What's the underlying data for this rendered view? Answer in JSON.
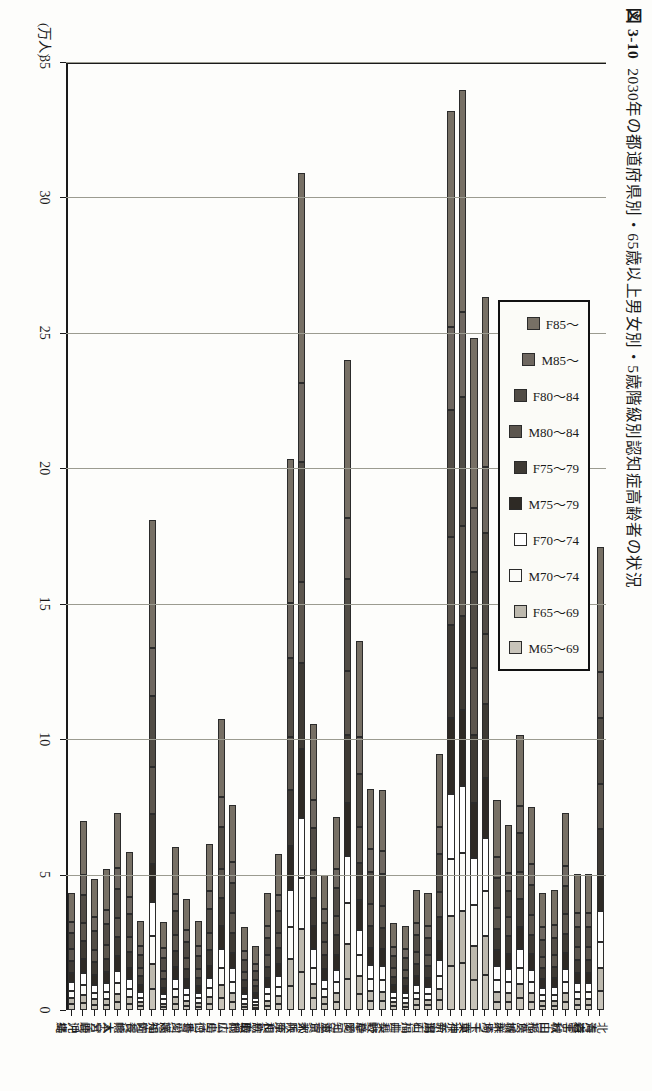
{
  "figure": {
    "number": "図 3-10",
    "title": "2030年の都道府県別・65歳以上男女別・5歳階級別認知症高齢者の状況",
    "unit_label": "(万人)"
  },
  "legend": {
    "items": [
      {
        "label": "F85～",
        "color": "#777065"
      },
      {
        "label": "M85～",
        "color": "#6e6760"
      },
      {
        "label": "F80～84",
        "color": "#514c45"
      },
      {
        "label": "M80～84",
        "color": "#5c564e"
      },
      {
        "label": "F75～79",
        "color": "#3e3a34"
      },
      {
        "label": "M75～79",
        "color": "#2e2a25"
      },
      {
        "label": "F70～74",
        "color": "#ffffff"
      },
      {
        "label": "M70～74",
        "color": "#fbfbf8"
      },
      {
        "label": "F65～69",
        "color": "#bdb9ae"
      },
      {
        "label": "M65～69",
        "color": "#c8c4ba"
      }
    ]
  },
  "chart_data": {
    "type": "bar",
    "orientation": "horizontal-stacked",
    "title": "2030年の都道府県別・65歳以上男女別・5歳階級別認知症高齢者の状況",
    "xlabel": "",
    "ylabel": "(万人)",
    "ylim": [
      0,
      35
    ],
    "yticks": [
      0,
      5,
      10,
      15,
      20,
      25,
      30,
      35
    ],
    "grid": true,
    "legend_position": "top-center",
    "categories": [
      "北海道",
      "青森",
      "岩手",
      "宮城",
      "秋田",
      "山形",
      "福島",
      "茨城",
      "栃木",
      "群馬",
      "埼玉",
      "千葉",
      "東京",
      "神奈川",
      "新潟",
      "富山",
      "石川",
      "福井",
      "山梨",
      "長野",
      "岐阜",
      "静岡",
      "愛知",
      "三重",
      "滋賀",
      "京都",
      "大阪",
      "兵庫",
      "奈良",
      "和歌山",
      "鳥取",
      "島根",
      "岡山",
      "広島",
      "山口",
      "徳島",
      "香川",
      "愛媛",
      "高知",
      "福岡",
      "佐賀",
      "長崎",
      "熊本",
      "大分",
      "宮崎",
      "鹿児島",
      "沖縄"
    ],
    "series": [
      {
        "name": "M65～69",
        "values": [
          0.72,
          0.19,
          0.19,
          0.3,
          0.16,
          0.16,
          0.29,
          0.45,
          0.3,
          0.31,
          1.28,
          1.11,
          1.72,
          1.63,
          0.36,
          0.17,
          0.18,
          0.12,
          0.13,
          0.32,
          0.32,
          0.58,
          1.15,
          0.29,
          0.22,
          0.44,
          1.4,
          0.87,
          0.24,
          0.16,
          0.09,
          0.11,
          0.3,
          0.44,
          0.22,
          0.12,
          0.16,
          0.22,
          0.11,
          0.79,
          0.13,
          0.22,
          0.28,
          0.19,
          0.18,
          0.26,
          0.21
        ]
      },
      {
        "name": "F65～69",
        "values": [
          0.83,
          0.22,
          0.22,
          0.34,
          0.19,
          0.18,
          0.33,
          0.51,
          0.34,
          0.36,
          1.44,
          1.27,
          1.92,
          1.83,
          0.41,
          0.19,
          0.21,
          0.14,
          0.15,
          0.36,
          0.37,
          0.66,
          1.29,
          0.33,
          0.25,
          0.51,
          1.6,
          1.0,
          0.28,
          0.19,
          0.1,
          0.13,
          0.34,
          0.5,
          0.26,
          0.14,
          0.18,
          0.25,
          0.13,
          0.9,
          0.15,
          0.25,
          0.32,
          0.22,
          0.21,
          0.3,
          0.24
        ]
      },
      {
        "name": "M70～74",
        "values": [
          0.96,
          0.26,
          0.26,
          0.41,
          0.22,
          0.22,
          0.4,
          0.6,
          0.4,
          0.43,
          1.68,
          1.48,
          2.16,
          2.1,
          0.49,
          0.23,
          0.25,
          0.17,
          0.18,
          0.44,
          0.45,
          0.79,
          1.5,
          0.4,
          0.3,
          0.6,
          1.88,
          1.18,
          0.33,
          0.23,
          0.12,
          0.16,
          0.41,
          0.6,
          0.32,
          0.17,
          0.22,
          0.31,
          0.16,
          1.05,
          0.18,
          0.3,
          0.39,
          0.27,
          0.25,
          0.36,
          0.27
        ]
      },
      {
        "name": "F70～74",
        "values": [
          1.14,
          0.31,
          0.31,
          0.48,
          0.27,
          0.26,
          0.47,
          0.7,
          0.47,
          0.51,
          1.94,
          1.74,
          2.46,
          2.42,
          0.58,
          0.27,
          0.29,
          0.2,
          0.21,
          0.52,
          0.53,
          0.93,
          1.73,
          0.47,
          0.35,
          0.71,
          2.2,
          1.39,
          0.39,
          0.27,
          0.15,
          0.19,
          0.49,
          0.71,
          0.38,
          0.2,
          0.26,
          0.37,
          0.19,
          1.23,
          0.21,
          0.36,
          0.46,
          0.32,
          0.3,
          0.43,
          0.31
        ]
      },
      {
        "name": "M75～79",
        "values": [
          1.33,
          0.38,
          0.38,
          0.57,
          0.33,
          0.32,
          0.57,
          0.82,
          0.55,
          0.61,
          2.22,
          2.03,
          2.82,
          2.79,
          0.71,
          0.33,
          0.34,
          0.24,
          0.25,
          0.62,
          0.63,
          1.09,
          1.99,
          0.56,
          0.4,
          0.83,
          2.55,
          1.62,
          0.46,
          0.33,
          0.18,
          0.23,
          0.58,
          0.84,
          0.46,
          0.25,
          0.31,
          0.45,
          0.24,
          1.43,
          0.25,
          0.44,
          0.55,
          0.39,
          0.36,
          0.52,
          0.35
        ]
      },
      {
        "name": "F75～79",
        "values": [
          1.69,
          0.48,
          0.48,
          0.72,
          0.42,
          0.41,
          0.72,
          1.02,
          0.69,
          0.77,
          2.74,
          2.54,
          3.48,
          3.44,
          0.9,
          0.42,
          0.43,
          0.3,
          0.31,
          0.78,
          0.8,
          1.37,
          2.48,
          0.71,
          0.5,
          1.06,
          3.17,
          2.05,
          0.58,
          0.42,
          0.23,
          0.29,
          0.74,
          1.06,
          0.59,
          0.32,
          0.4,
          0.58,
          0.31,
          1.82,
          0.32,
          0.56,
          0.7,
          0.5,
          0.46,
          0.67,
          0.44
        ]
      },
      {
        "name": "M80～84",
        "values": [
          1.66,
          0.49,
          0.49,
          0.71,
          0.43,
          0.42,
          0.73,
          0.99,
          0.67,
          0.76,
          2.6,
          2.45,
          3.32,
          3.27,
          0.92,
          0.42,
          0.43,
          0.3,
          0.31,
          0.79,
          0.8,
          1.34,
          2.36,
          0.7,
          0.49,
          1.03,
          3.02,
          1.98,
          0.56,
          0.42,
          0.23,
          0.3,
          0.74,
          1.05,
          0.6,
          0.32,
          0.4,
          0.59,
          0.32,
          1.77,
          0.32,
          0.57,
          0.71,
          0.51,
          0.47,
          0.68,
          0.42
        ]
      },
      {
        "name": "F80～84",
        "values": [
          2.46,
          0.73,
          0.73,
          1.05,
          0.65,
          0.63,
          1.09,
          1.44,
          0.97,
          1.12,
          3.72,
          3.55,
          4.76,
          4.68,
          1.38,
          0.63,
          0.64,
          0.45,
          0.46,
          1.18,
          1.19,
          1.97,
          3.42,
          1.04,
          0.72,
          1.53,
          4.4,
          2.92,
          0.83,
          0.63,
          0.35,
          0.45,
          1.1,
          1.56,
          0.9,
          0.48,
          0.6,
          0.88,
          0.48,
          2.6,
          0.48,
          0.85,
          1.06,
          0.76,
          0.7,
          1.02,
          0.61
        ]
      },
      {
        "name": "M85～",
        "values": [
          1.7,
          0.53,
          0.53,
          0.74,
          0.48,
          0.47,
          0.79,
          0.99,
          0.67,
          0.79,
          2.42,
          2.37,
          3.14,
          3.07,
          1.0,
          0.45,
          0.45,
          0.32,
          0.33,
          0.85,
          0.84,
          1.35,
          2.25,
          0.72,
          0.49,
          1.05,
          2.95,
          2.01,
          0.57,
          0.45,
          0.25,
          0.33,
          0.78,
          1.09,
          0.65,
          0.35,
          0.43,
          0.64,
          0.35,
          1.78,
          0.34,
          0.62,
          0.76,
          0.55,
          0.51,
          0.74,
          0.41
        ]
      },
      {
        "name": "F85～",
        "values": [
          4.61,
          1.42,
          1.42,
          1.97,
          1.3,
          1.27,
          2.12,
          2.62,
          1.77,
          2.1,
          6.28,
          6.26,
          8.19,
          7.97,
          2.7,
          1.2,
          1.21,
          0.86,
          0.88,
          2.28,
          2.24,
          3.54,
          5.82,
          1.92,
          1.28,
          2.8,
          7.73,
          5.32,
          1.51,
          1.22,
          0.67,
          0.89,
          2.08,
          2.9,
          1.76,
          0.95,
          1.15,
          1.73,
          0.95,
          4.72,
          0.92,
          1.68,
          2.06,
          1.49,
          1.38,
          2.01,
          1.07
        ]
      }
    ],
    "totals": [
      17.1,
      5.01,
      5.01,
      7.29,
      4.45,
      4.34,
      7.51,
      10.14,
      6.83,
      7.76,
      26.32,
      24.8,
      34.0,
      33.2,
      9.45,
      4.31,
      4.43,
      3.1,
      3.21,
      8.14,
      8.17,
      13.62,
      24.0,
      7.14,
      5.0,
      10.56,
      30.9,
      20.34,
      5.75,
      4.32,
      2.37,
      3.08,
      7.56,
      10.75,
      6.14,
      3.3,
      4.11,
      6.02,
      3.24,
      17.09,
      3.3,
      5.85,
      7.29,
      5.2,
      4.82,
      6.99,
      4.33
    ]
  }
}
